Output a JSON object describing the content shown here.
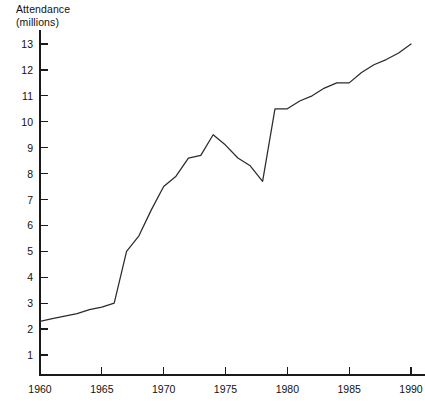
{
  "chart_data": {
    "type": "line",
    "title": "",
    "ylabel": "Attendance\n(millions)",
    "xlabel": "",
    "xlim": [
      1960,
      1990
    ],
    "ylim": [
      0,
      13.4
    ],
    "grid": false,
    "legend": false,
    "y_ticks": [
      1,
      2,
      3,
      4,
      5,
      6,
      7,
      8,
      9,
      10,
      11,
      12,
      13
    ],
    "y_tick_labels": [
      "1",
      "2",
      "3",
      "4",
      "5",
      "6",
      "7",
      "8",
      "9",
      "10",
      "11",
      "12",
      "13"
    ],
    "x_ticks": [
      1960,
      1965,
      1970,
      1975,
      1980,
      1985,
      1990
    ],
    "x_tick_labels": [
      "1960",
      "1965",
      "1970",
      "1975",
      "1980",
      "1985",
      "1990"
    ],
    "x": [
      1960,
      1961,
      1962,
      1963,
      1964,
      1965,
      1966,
      1967,
      1968,
      1969,
      1970,
      1971,
      1972,
      1973,
      1974,
      1975,
      1976,
      1977,
      1978,
      1979,
      1980,
      1981,
      1982,
      1983,
      1984,
      1985,
      1986,
      1987,
      1988,
      1989,
      1990
    ],
    "values": [
      2.3,
      2.4,
      2.5,
      2.6,
      2.75,
      2.85,
      3.0,
      5.0,
      5.6,
      6.6,
      7.5,
      7.9,
      8.6,
      8.7,
      9.5,
      9.1,
      8.6,
      8.3,
      7.7,
      10.5,
      10.5,
      10.8,
      11.0,
      11.3,
      11.5,
      11.5,
      11.9,
      12.2,
      12.4,
      12.65,
      13.0
    ],
    "series_name": "Attendance",
    "line_color": "#2b2b2b",
    "axis_color": "#1a1a1a",
    "background": "#ffffff"
  },
  "annotations": {
    "peak_label": "",
    "dip_label": ""
  }
}
